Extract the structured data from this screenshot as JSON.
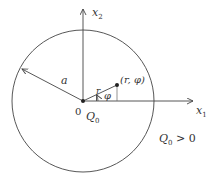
{
  "diagram": {
    "axes": {
      "x_label": "x",
      "x_sub": "1",
      "y_label": "x",
      "y_sub": "2"
    },
    "origin_label": "0",
    "center_charge": {
      "label": "Q",
      "sub": "0"
    },
    "radius_label": "a",
    "point_label": "(r, φ)",
    "r_label": "r",
    "phi_label": "φ",
    "condition": {
      "label": "Q",
      "sub": "0",
      "rest": " > 0"
    },
    "colors": {
      "stroke": "#444444",
      "text": "#333333",
      "background": "#ffffff"
    }
  }
}
